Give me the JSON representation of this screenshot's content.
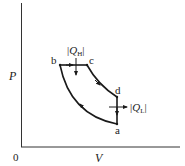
{
  "diagram": {
    "type": "pv-cycle",
    "axes": {
      "x_label": "V",
      "y_label": "P",
      "origin_label": "0"
    },
    "points": [
      {
        "id": "b",
        "label": "b",
        "x": 60,
        "y": 65
      },
      {
        "id": "c",
        "label": "c",
        "x": 87,
        "y": 65
      },
      {
        "id": "d",
        "label": "d",
        "x": 117,
        "y": 97
      },
      {
        "id": "a",
        "label": "a",
        "x": 117,
        "y": 124
      }
    ],
    "heat_in": {
      "symbol": "Q",
      "subscript": "H"
    },
    "heat_out": {
      "symbol": "Q",
      "subscript": "L"
    },
    "colors": {
      "line": "#1a1a1a",
      "text": "#222222"
    }
  }
}
